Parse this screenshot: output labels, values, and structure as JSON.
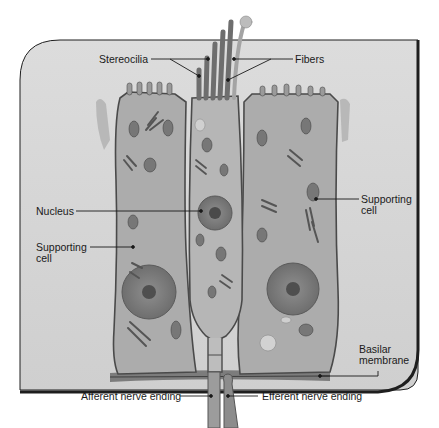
{
  "diagram": {
    "colors": {
      "panel": "#d4d4d4",
      "panel_border": "#1e1e1e",
      "cell_fill": "#a9a9a9",
      "cell_light": "#bdbdbd",
      "membrane_outline": "#4a4a4a",
      "nucleus": "#858585",
      "nucleolus": "#555555",
      "fibers": "#7a7a7a",
      "label_text": "#1a1a1a",
      "leader_line": "#1a1a1a"
    },
    "labels": {
      "stereocilia": "Stereocilia",
      "fibers": "Fibers",
      "nucleus": "Nucleus",
      "supporting_cell_right_line1": "Supporting",
      "supporting_cell_right_line2": "cell",
      "supporting_cell_left_line1": "Supporting",
      "supporting_cell_left_line2": "cell",
      "basilar_membrane_line1": "Basilar",
      "basilar_membrane_line2": "membrane",
      "afferent_nerve_ending": "Afferent nerve ending",
      "efferent_nerve_ending": "Efferent nerve ending"
    }
  }
}
